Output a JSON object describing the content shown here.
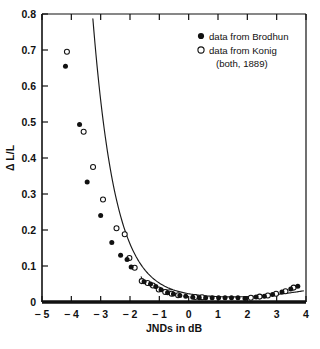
{
  "chart_data": {
    "type": "scatter",
    "title": "",
    "subtitle": "",
    "xlabel": "JNDs in dB",
    "ylabel": "Δ L/L",
    "xlim": [
      -5,
      4
    ],
    "ylim": [
      0,
      0.8
    ],
    "xticks": [
      -5,
      -4,
      -3,
      -2,
      -1,
      0,
      1,
      2,
      3,
      4
    ],
    "xtick_labels": [
      "− 5",
      "− 4",
      "− 3",
      "− 2",
      "− 1",
      "0",
      "1",
      "2",
      "3",
      "4"
    ],
    "yticks": [
      0,
      0.1,
      0.2,
      0.3,
      0.4,
      0.5,
      0.6,
      0.7,
      0.8
    ],
    "ytick_labels": [
      "0",
      "0.1",
      "0.2",
      "0.3",
      "0.4",
      "0.5",
      "0.6",
      "0.7",
      "0.8"
    ],
    "grid": false,
    "legend_position": "top-right",
    "legend": [
      {
        "marker": "filled-circle",
        "label": "data from Brodhun"
      },
      {
        "marker": "open-circle",
        "label": "data from Konig"
      },
      {
        "marker": "none",
        "label": "(both, 1889)"
      }
    ],
    "series": [
      {
        "name": "data from Brodhun",
        "marker": "filled-circle",
        "color": "#111111",
        "points": [
          [
            -4.2,
            0.655
          ],
          [
            -3.72,
            0.493
          ],
          [
            -3.46,
            0.333
          ],
          [
            -3.0,
            0.24
          ],
          [
            -2.62,
            0.165
          ],
          [
            -2.32,
            0.13
          ],
          [
            -2.1,
            0.118
          ],
          [
            -1.96,
            0.097
          ],
          [
            -1.52,
            0.056
          ],
          [
            -1.3,
            0.05
          ],
          [
            -1.12,
            0.043
          ],
          [
            -0.94,
            0.034
          ],
          [
            -0.72,
            0.026
          ],
          [
            -0.52,
            0.022
          ],
          [
            -0.3,
            0.018
          ],
          [
            -0.1,
            0.016
          ],
          [
            0.14,
            0.013
          ],
          [
            0.36,
            0.012
          ],
          [
            0.58,
            0.012
          ],
          [
            0.8,
            0.012
          ],
          [
            1.02,
            0.012
          ],
          [
            1.24,
            0.012
          ],
          [
            1.46,
            0.012
          ],
          [
            1.68,
            0.012
          ],
          [
            1.92,
            0.01
          ],
          [
            2.3,
            0.014
          ],
          [
            2.58,
            0.016
          ],
          [
            2.86,
            0.021
          ],
          [
            3.18,
            0.028
          ],
          [
            3.48,
            0.036
          ],
          [
            3.72,
            0.044
          ]
        ]
      },
      {
        "name": "data from Konig",
        "marker": "open-circle",
        "color": "#111111",
        "points": [
          [
            -4.15,
            0.695
          ],
          [
            -3.58,
            0.473
          ],
          [
            -3.26,
            0.375
          ],
          [
            -2.92,
            0.285
          ],
          [
            -2.46,
            0.205
          ],
          [
            -2.18,
            0.188
          ],
          [
            -2.02,
            0.122
          ],
          [
            -1.84,
            0.095
          ],
          [
            -1.6,
            0.058
          ],
          [
            -1.4,
            0.053
          ],
          [
            -1.22,
            0.046
          ],
          [
            -1.02,
            0.035
          ],
          [
            -0.8,
            0.028
          ],
          [
            -0.58,
            0.023
          ],
          [
            -0.36,
            0.019
          ],
          [
            0.22,
            0.014
          ],
          [
            0.46,
            0.013
          ],
          [
            2.12,
            0.012
          ],
          [
            2.42,
            0.015
          ],
          [
            2.7,
            0.018
          ],
          [
            2.98,
            0.023
          ],
          [
            3.3,
            0.03
          ],
          [
            3.58,
            0.04
          ]
        ]
      }
    ],
    "fit_curve": {
      "name": "fitted-curve",
      "description": "monotonic decreasing then rising fit through both data sets"
    },
    "secondary_curve": {
      "name": "secondary-branch",
      "description": "short curve segment branching near -1.5 to -0.6 dB"
    }
  },
  "figure": {
    "width": 320,
    "height": 349
  }
}
